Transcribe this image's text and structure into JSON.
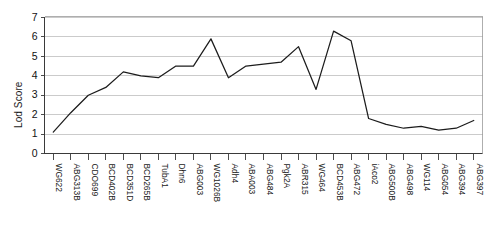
{
  "chart_data": {
    "type": "line",
    "title": "",
    "xlabel": "",
    "ylabel": "Lod Score",
    "ylim": [
      0,
      7
    ],
    "yticks": [
      0,
      1,
      2,
      3,
      4,
      5,
      6,
      7
    ],
    "grid": true,
    "legend": "none",
    "line_color": "#1c1c1c",
    "categories": [
      "WG622",
      "ABG313B",
      "CDO699",
      "BCD402B",
      "BCD351D",
      "BCD265B",
      "TubA1",
      "Dhn6",
      "ABG003",
      "WG1026B",
      "Adh4",
      "ABA003",
      "ABG484",
      "Pgk2A",
      "ABR315",
      "WG464",
      "BCD453B",
      "ABG472",
      "iAco2",
      "ABG500B",
      "ABG498",
      "WG114",
      "ABG054",
      "ABG394",
      "ABG397"
    ],
    "values": [
      1.1,
      2.1,
      3.0,
      3.4,
      4.2,
      4.0,
      3.9,
      4.5,
      4.5,
      5.9,
      3.9,
      4.5,
      4.6,
      4.7,
      5.5,
      3.3,
      6.3,
      5.8,
      1.8,
      1.5,
      1.3,
      1.4,
      1.2,
      1.3,
      1.7
    ]
  }
}
